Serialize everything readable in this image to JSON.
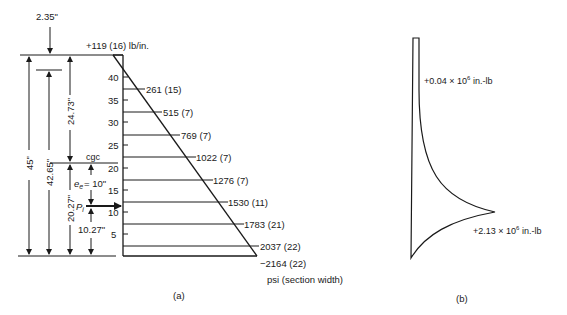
{
  "figure_a": {
    "caption": "(a)",
    "top_dimension": "2.35\"",
    "top_load_label": "+119 (16) lb/in.",
    "dimensions": {
      "total_height": "45\"",
      "height_42": "42.65\"",
      "upper_to_cgc": "24.73\"",
      "lower_to_cgc": "20.27\"",
      "eccentricity_label": "= 10\"",
      "eccentricity_symbol": "e",
      "eccentricity_subscript": "e",
      "force_symbol": "P",
      "force_subscript": "i",
      "force_to_bottom": "10.27\"",
      "cgc_label": "cgc"
    },
    "axis_ticks": [
      "40",
      "35",
      "30",
      "25",
      "20",
      "15",
      "10",
      "5"
    ],
    "stress_labels": [
      "261 (15)",
      "515 (7)",
      "769 (7)",
      "1022 (7)",
      "1276 (7)",
      "1530 (11)",
      "1783 (21)",
      "2037 (22)",
      "−2164 (22)"
    ],
    "units_label": "psi (section width)"
  },
  "figure_b": {
    "caption": "(b)",
    "top_moment_label": "+0.04 × 10",
    "top_moment_exp": "6",
    "top_moment_unit": " in.-lb",
    "max_moment_label": "+2.13 × 10",
    "max_moment_exp": "6",
    "max_moment_unit": " in.-lb"
  }
}
